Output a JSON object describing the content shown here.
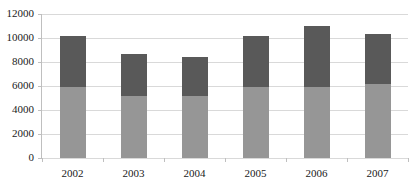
{
  "chart_data": {
    "type": "bar",
    "title": "",
    "subtitle": "",
    "xlabel": "",
    "ylabel": "",
    "stacked": true,
    "grid": true,
    "legend": "none",
    "categories": [
      "2002",
      "2003",
      "2004",
      "2005",
      "2006",
      "2007"
    ],
    "ylim": [
      0,
      12000
    ],
    "ytick_labels": [
      "0",
      "2000",
      "4000",
      "6000",
      "8000",
      "10000",
      "12000"
    ],
    "ytick_values": [
      0,
      2000,
      4000,
      6000,
      8000,
      10000,
      12000
    ],
    "series": [
      {
        "name": "lower",
        "color": "#969696",
        "values": [
          5900,
          5150,
          5150,
          5950,
          5950,
          6150
        ]
      },
      {
        "name": "upper",
        "color": "#595959",
        "values": [
          4300,
          3500,
          3300,
          4250,
          5050,
          4150
        ]
      }
    ],
    "totals": [
      10200,
      8650,
      8450,
      10200,
      11000,
      10300
    ]
  },
  "style": {
    "plot_background": "#ffffff",
    "grid_color": "#d9d9d9",
    "axis_color": "#bfbfbf",
    "text_color": "#1a1a1a"
  }
}
